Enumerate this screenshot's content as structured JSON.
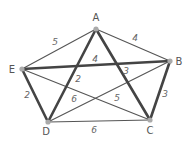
{
  "diagram": {
    "type": "weighted-graph",
    "colors": {
      "thin_edge": "#555555",
      "thick_edge": "#444444",
      "node": "#aaaaaa",
      "label": "#555555"
    },
    "nodes": [
      {
        "id": "A",
        "label": "A",
        "x": 96,
        "y": 29,
        "lx": 96,
        "ly": 21
      },
      {
        "id": "B",
        "label": "B",
        "x": 170,
        "y": 61,
        "lx": 179,
        "ly": 65
      },
      {
        "id": "C",
        "label": "C",
        "x": 150,
        "y": 120,
        "lx": 150,
        "ly": 134
      },
      {
        "id": "D",
        "label": "D",
        "x": 48,
        "y": 122,
        "lx": 46,
        "ly": 135
      },
      {
        "id": "E",
        "label": "E",
        "x": 22,
        "y": 69,
        "lx": 12,
        "ly": 73
      }
    ],
    "edges": [
      {
        "from": "A",
        "to": "E",
        "weight": "5",
        "bold": false,
        "wx": 55,
        "wy": 45
      },
      {
        "from": "A",
        "to": "B",
        "weight": "4",
        "bold": false,
        "wx": 135,
        "wy": 41
      },
      {
        "from": "E",
        "to": "B",
        "weight": "4",
        "bold": true,
        "wx": 95,
        "wy": 62
      },
      {
        "from": "A",
        "to": "D",
        "weight": "2",
        "bold": true,
        "wx": 78,
        "wy": 82
      },
      {
        "from": "A",
        "to": "C",
        "weight": "3",
        "bold": true,
        "wx": 126,
        "wy": 74
      },
      {
        "from": "E",
        "to": "D",
        "weight": "2",
        "bold": true,
        "wx": 27,
        "wy": 98
      },
      {
        "from": "B",
        "to": "C",
        "weight": "3",
        "bold": true,
        "wx": 165,
        "wy": 97
      },
      {
        "from": "E",
        "to": "C",
        "weight": "6",
        "bold": false,
        "wx": 74,
        "wy": 102
      },
      {
        "from": "D",
        "to": "B",
        "weight": "5",
        "bold": false,
        "wx": 117,
        "wy": 101
      },
      {
        "from": "D",
        "to": "C",
        "weight": "6",
        "bold": false,
        "wx": 94,
        "wy": 133
      }
    ]
  }
}
